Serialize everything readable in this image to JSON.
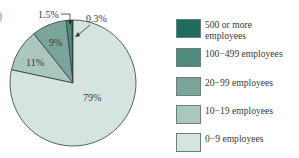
{
  "chart_data": {
    "type": "pie",
    "title": "",
    "categories": [
      "500 or more employees",
      "100−499 employees",
      "20−99 employees",
      "10−19 employees",
      "0−9 employees"
    ],
    "values": [
      0.3,
      1.5,
      9,
      11,
      79
    ],
    "labels": [
      "0.3%",
      "1.5%",
      "9%",
      "11%",
      "79%"
    ],
    "colors": [
      "#1f6b5c",
      "#4e8a7e",
      "#7ba59b",
      "#a9c6bf",
      "#d6e4e0"
    ],
    "legend_position": "right"
  },
  "legend": {
    "items": [
      {
        "label": "500 or more employees",
        "color": "#1f6b5c"
      },
      {
        "label": "100−499 employees",
        "color": "#4e8a7e"
      },
      {
        "label": "20−99 employees",
        "color": "#7ba59b"
      },
      {
        "label": "10−19 employees",
        "color": "#a9c6bf"
      },
      {
        "label": "0−9 employees",
        "color": "#d6e4e0"
      }
    ]
  },
  "slice_labels": {
    "s500": "0.3%",
    "s100": "1.5%",
    "s20": "9%",
    "s10": "11%",
    "s0": "79%"
  },
  "edge_glyph": ")"
}
